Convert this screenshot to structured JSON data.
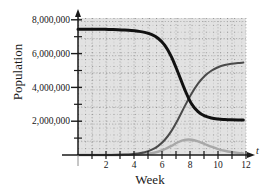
{
  "figure": {
    "name": "population-vs-week-graph",
    "plot_bg_color": "#e2e2e2",
    "grid_color": "#9a9a9a",
    "axis_color": "#1a1a1a"
  },
  "axes": {
    "y": {
      "label": "Population",
      "tick_labels": [
        "8,000,000",
        "6,000,000",
        "4,000,000",
        "2,000,000"
      ],
      "tick_values": [
        8000000,
        6000000,
        4000000,
        2000000
      ],
      "minor_tick_values": [
        7000000,
        5000000,
        3000000,
        1000000
      ],
      "range": [
        0,
        8600000
      ]
    },
    "x": {
      "label": "Week",
      "variable": "t",
      "tick_labels": [
        "2",
        "4",
        "6",
        "8",
        "10",
        "12"
      ],
      "tick_values": [
        2,
        4,
        6,
        8,
        10,
        12
      ],
      "all_tick_values": [
        1,
        2,
        3,
        4,
        5,
        6,
        7,
        8,
        9,
        10,
        11,
        12
      ],
      "range": [
        0,
        12.6
      ]
    }
  },
  "chart_data": {
    "type": "line",
    "title": "",
    "xlabel": "Week",
    "ylabel": "Population",
    "xlim": [
      0,
      12.6
    ],
    "ylim": [
      0,
      8600000
    ],
    "grid": true,
    "legend": "none",
    "x": [
      0,
      0.5,
      1,
      1.5,
      2,
      2.5,
      3,
      3.5,
      4,
      4.5,
      5,
      5.5,
      6,
      6.5,
      7,
      7.5,
      8,
      8.5,
      9,
      9.5,
      10,
      10.5,
      11,
      11.5,
      12,
      12.4
    ],
    "series": [
      {
        "name": "declining-population",
        "color": "#111111",
        "width": 3.0,
        "values": [
          7900000,
          7900000,
          7900000,
          7895000,
          7890000,
          7880000,
          7870000,
          7850000,
          7820000,
          7770000,
          7700000,
          7570000,
          7330000,
          6900000,
          6180000,
          5180000,
          4120000,
          3230000,
          2720000,
          2450000,
          2320000,
          2260000,
          2230000,
          2210000,
          2200000,
          2200000
        ]
      },
      {
        "name": "rising-population",
        "color": "#4a4a4a",
        "width": 2.0,
        "values": [
          0,
          0,
          0,
          0,
          0,
          5000,
          12000,
          25000,
          50000,
          95000,
          175000,
          320000,
          560000,
          940000,
          1500000,
          2230000,
          3050000,
          3830000,
          4480000,
          4960000,
          5290000,
          5510000,
          5650000,
          5730000,
          5780000,
          5800000
        ]
      },
      {
        "name": "transient-population",
        "color": "#a8a8a8",
        "width": 2.4,
        "values": [
          0,
          0,
          0,
          0,
          0,
          0,
          2000,
          5000,
          12000,
          26000,
          55000,
          110000,
          205000,
          360000,
          570000,
          800000,
          950000,
          960000,
          855000,
          690000,
          520000,
          375000,
          265000,
          185000,
          130000,
          105000
        ]
      }
    ]
  }
}
